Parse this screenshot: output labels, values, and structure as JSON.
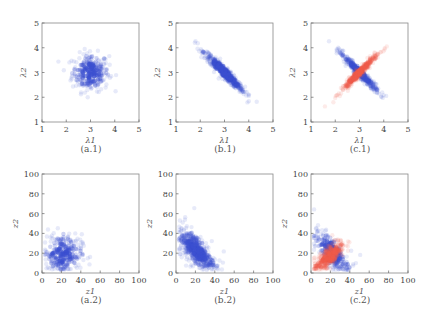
{
  "colors": {
    "series_a": "#3b4fd0",
    "series_b": "#f05a4a",
    "frame": "#888888"
  },
  "chart_data": [
    {
      "id": "a1",
      "type": "scatter",
      "caption": "(a.1)",
      "xlabel": "λ1",
      "ylabel": "λ2",
      "xlim": [
        1,
        5
      ],
      "ylim": [
        1,
        5
      ],
      "xticks": [
        "1",
        "2",
        "3",
        "4",
        "5"
      ],
      "yticks": [
        "1",
        "2",
        "3",
        "4",
        "5"
      ],
      "grid": false,
      "series": [
        {
          "name": "blue",
          "color": "#3b4fd0",
          "center": [
            3.0,
            3.0
          ],
          "spread": [
            0.38,
            0.38
          ],
          "corr": 0.0,
          "n": 260
        }
      ]
    },
    {
      "id": "b1",
      "type": "scatter",
      "caption": "(b.1)",
      "xlabel": "λ1",
      "ylabel": "λ2",
      "xlim": [
        1,
        5
      ],
      "ylim": [
        1,
        5
      ],
      "xticks": [
        "1",
        "2",
        "3",
        "4",
        "5"
      ],
      "yticks": [
        "1",
        "2",
        "3",
        "4",
        "5"
      ],
      "grid": false,
      "series": [
        {
          "name": "blue",
          "color": "#3b4fd0",
          "center": [
            3.0,
            3.0
          ],
          "spread": [
            0.42,
            0.42
          ],
          "corr": -0.96,
          "n": 500
        }
      ]
    },
    {
      "id": "c1",
      "type": "scatter",
      "caption": "(c.1)",
      "xlabel": "λ1",
      "ylabel": "λ2",
      "xlim": [
        1,
        5
      ],
      "ylim": [
        1,
        5
      ],
      "xticks": [
        "1",
        "2",
        "3",
        "4",
        "5"
      ],
      "yticks": [
        "1",
        "2",
        "3",
        "4",
        "5"
      ],
      "grid": false,
      "series": [
        {
          "name": "blue",
          "color": "#3b4fd0",
          "center": [
            3.0,
            3.0
          ],
          "spread": [
            0.42,
            0.42
          ],
          "corr": -0.97,
          "n": 300
        },
        {
          "name": "red",
          "color": "#f05a4a",
          "center": [
            3.0,
            3.0
          ],
          "spread": [
            0.38,
            0.38
          ],
          "corr": 0.97,
          "n": 300
        }
      ]
    },
    {
      "id": "a2",
      "type": "scatter",
      "caption": "(a.2)",
      "xlabel": "z1",
      "ylabel": "z2",
      "xlim": [
        0,
        100
      ],
      "ylim": [
        0,
        100
      ],
      "xticks": [
        "0",
        "20",
        "40",
        "60",
        "80",
        "100"
      ],
      "yticks": [
        "0",
        "20",
        "40",
        "60",
        "80",
        "100"
      ],
      "grid": false,
      "series": [
        {
          "name": "blue",
          "color": "#3b4fd0",
          "center": [
            20,
            18
          ],
          "spread": [
            10,
            10
          ],
          "corr": 0.0,
          "n": 260,
          "skew": true
        }
      ]
    },
    {
      "id": "b2",
      "type": "scatter",
      "caption": "(b.2)",
      "xlabel": "z1",
      "ylabel": "z2",
      "xlim": [
        0,
        100
      ],
      "ylim": [
        0,
        100
      ],
      "xticks": [
        "0",
        "20",
        "40",
        "60",
        "80",
        "100"
      ],
      "yticks": [
        "0",
        "20",
        "40",
        "60",
        "80",
        "100"
      ],
      "grid": false,
      "series": [
        {
          "name": "blue",
          "color": "#3b4fd0",
          "center": [
            20,
            22
          ],
          "spread": [
            10,
            11
          ],
          "corr": -0.7,
          "n": 400,
          "skew": true
        }
      ]
    },
    {
      "id": "c2",
      "type": "scatter",
      "caption": "(c.2)",
      "xlabel": "z1",
      "ylabel": "z2",
      "xlim": [
        0,
        100
      ],
      "ylim": [
        0,
        100
      ],
      "xticks": [
        "0",
        "20",
        "40",
        "60",
        "80",
        "100"
      ],
      "yticks": [
        "0",
        "20",
        "40",
        "60",
        "80",
        "100"
      ],
      "grid": false,
      "series": [
        {
          "name": "blue",
          "color": "#3b4fd0",
          "center": [
            20,
            20
          ],
          "spread": [
            9,
            11
          ],
          "corr": -0.7,
          "n": 250,
          "skew": true
        },
        {
          "name": "red",
          "color": "#f05a4a",
          "center": [
            18,
            16
          ],
          "spread": [
            8,
            8
          ],
          "corr": 0.75,
          "n": 250,
          "skew": true
        }
      ]
    }
  ]
}
